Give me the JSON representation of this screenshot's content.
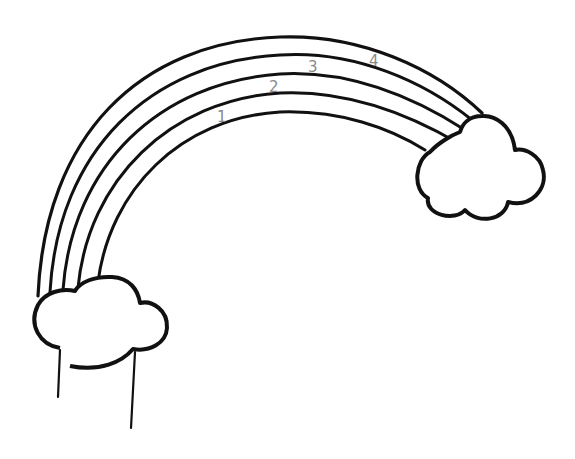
{
  "drawing": {
    "subject": "rainbow with clouds",
    "stroke_color": "#111111",
    "label_color": "#8a8a8a",
    "background": "#ffffff",
    "band_labels": [
      "1",
      "2",
      "3",
      "4"
    ]
  }
}
